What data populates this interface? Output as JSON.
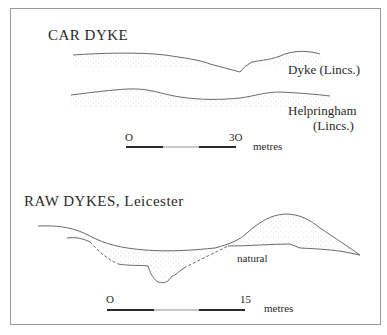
{
  "car_dyke": {
    "title": "CAR DYKE",
    "profile_1_label": "Dyke (Lincs.)",
    "profile_2_label_line1": "Helpringham",
    "profile_2_label_line2": "(Lincs.)",
    "scale": {
      "start": "O",
      "end": "3O",
      "unit": "metres"
    }
  },
  "raw_dykes": {
    "title": "RAW  DYKES, Leicester",
    "annotation": "natural",
    "scale": {
      "start": "O",
      "end": "15",
      "unit": "metres"
    }
  },
  "colors": {
    "line": "#6a6a6a",
    "stipple": "#b8b8b8",
    "frame": "#9a9a9a",
    "scale_dark": "#2a2a2a",
    "scale_light": "#c8c8c8"
  }
}
